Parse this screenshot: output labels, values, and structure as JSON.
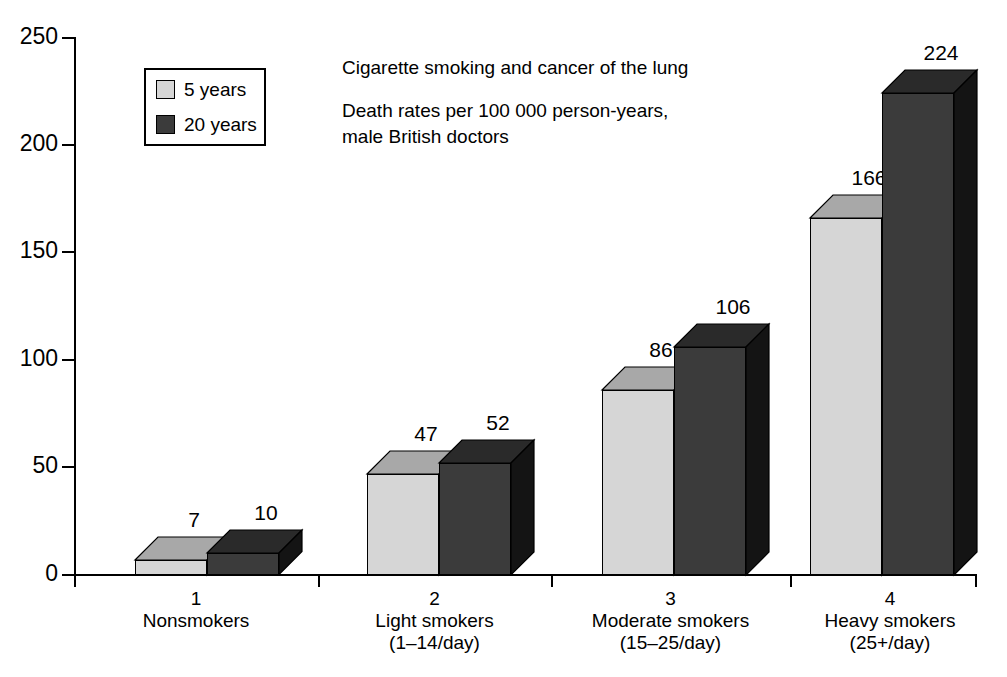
{
  "chart_data": {
    "type": "bar",
    "title": "Cigarette smoking and cancer of the lung",
    "subtitle_line1": "Death rates per 100 000 person-years,",
    "subtitle_line2": "male British doctors",
    "xlabel": "",
    "ylabel": "",
    "ylim": [
      0,
      250
    ],
    "yticks": [
      0,
      50,
      100,
      150,
      200,
      250
    ],
    "ytick_labels": [
      "0",
      "50",
      "100",
      "150",
      "200",
      "250"
    ],
    "grid": false,
    "legend_position": "upper-left-inside",
    "categories": [
      {
        "num": "1",
        "name": "Nonsmokers",
        "range": ""
      },
      {
        "num": "2",
        "name": "Light smokers",
        "range": "(1–14/day)"
      },
      {
        "num": "3",
        "name": "Moderate smokers",
        "range": "(15–25/day)"
      },
      {
        "num": "4",
        "name": "Heavy smokers",
        "range": "(25+/day)"
      }
    ],
    "series": [
      {
        "name": "5 years",
        "values": [
          7,
          47,
          86,
          166
        ],
        "color_front": "#d6d6d6",
        "color_top": "#a8a8a8",
        "color_side": "#8f8f8f"
      },
      {
        "name": "20 years",
        "values": [
          10,
          52,
          106,
          224
        ],
        "color_front": "#3b3b3b",
        "color_top": "#2a2a2a",
        "color_side": "#141414"
      }
    ],
    "value_labels": [
      {
        "series": "5 years",
        "values": [
          "7",
          "47",
          "86",
          "166"
        ]
      },
      {
        "series": "20 years",
        "values": [
          "10",
          "52",
          "106",
          "224"
        ]
      }
    ]
  },
  "legend": {
    "items": [
      {
        "label": "5 years"
      },
      {
        "label": "20 years"
      }
    ]
  },
  "axis": {
    "y_labels": [
      "250",
      "200",
      "150",
      "100",
      "50",
      "0"
    ]
  }
}
